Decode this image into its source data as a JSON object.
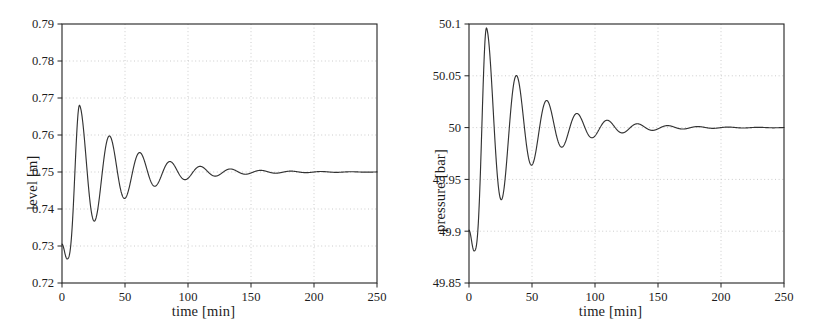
{
  "figure": {
    "background": "#ffffff",
    "line_color": "#333333",
    "grid_color": "#cccccc",
    "axis_color": "#222222"
  },
  "chart_data": [
    {
      "type": "line",
      "panel": "left",
      "title": "",
      "xlabel": "time [min]",
      "ylabel": "level [m]",
      "xlim": [
        0,
        250
      ],
      "ylim": [
        0.72,
        0.79
      ],
      "xticks": [
        0,
        50,
        100,
        150,
        200,
        250
      ],
      "xtick_labels": [
        "0",
        "50",
        "100",
        "150",
        "200",
        "250"
      ],
      "yticks": [
        0.72,
        0.73,
        0.74,
        0.75,
        0.76,
        0.77,
        0.78,
        0.79
      ],
      "ytick_labels": [
        "0.72",
        "0.73",
        "0.74",
        "0.75",
        "0.76",
        "0.77",
        "0.78",
        "0.79"
      ],
      "grid": true,
      "legend": null,
      "series": [
        {
          "name": "level",
          "steady_state": 0.75,
          "initial_value": 0.7305,
          "description": "damped oscillation settling to 0.75 m",
          "extrema": [
            {
              "t": 0,
              "y": 0.7305
            },
            {
              "t": 4,
              "y": 0.7265
            },
            {
              "t": 14,
              "y": 0.768
            },
            {
              "t": 26,
              "y": 0.7373
            },
            {
              "t": 38,
              "y": 0.7597
            },
            {
              "t": 50,
              "y": 0.7432
            },
            {
              "t": 62,
              "y": 0.7551
            },
            {
              "t": 74,
              "y": 0.7464
            },
            {
              "t": 86,
              "y": 0.7528
            },
            {
              "t": 98,
              "y": 0.7481
            },
            {
              "t": 110,
              "y": 0.7515
            },
            {
              "t": 122,
              "y": 0.7491
            },
            {
              "t": 134,
              "y": 0.7508
            },
            {
              "t": 146,
              "y": 0.7495
            },
            {
              "t": 158,
              "y": 0.7504
            },
            {
              "t": 170,
              "y": 0.7497
            },
            {
              "t": 182,
              "y": 0.7502
            },
            {
              "t": 194,
              "y": 0.7499
            },
            {
              "t": 250,
              "y": 0.75
            }
          ]
        }
      ]
    },
    {
      "type": "line",
      "panel": "right",
      "title": "",
      "xlabel": "time [min]",
      "ylabel": "pressure [bar]",
      "xlim": [
        0,
        250
      ],
      "ylim": [
        49.85,
        50.1
      ],
      "xticks": [
        0,
        50,
        100,
        150,
        200,
        250
      ],
      "xtick_labels": [
        "0",
        "50",
        "100",
        "150",
        "200",
        "250"
      ],
      "yticks": [
        49.85,
        49.9,
        49.95,
        50,
        50.05,
        50.1
      ],
      "ytick_labels": [
        "49.85",
        "49.9",
        "49.95",
        "50",
        "50.05",
        "50.1"
      ],
      "grid": true,
      "legend": null,
      "series": [
        {
          "name": "pressure",
          "steady_state": 50.0,
          "initial_value": 49.901,
          "description": "damped oscillation settling to 50 bar",
          "extrema": [
            {
              "t": 0,
              "y": 49.901
            },
            {
              "t": 4,
              "y": 49.881
            },
            {
              "t": 14,
              "y": 50.096
            },
            {
              "t": 26,
              "y": 49.937
            },
            {
              "t": 38,
              "y": 50.05
            },
            {
              "t": 50,
              "y": 49.965
            },
            {
              "t": 62,
              "y": 50.026
            },
            {
              "t": 74,
              "y": 49.98
            },
            {
              "t": 86,
              "y": 50.013
            },
            {
              "t": 98,
              "y": 49.991
            },
            {
              "t": 110,
              "y": 50.007
            },
            {
              "t": 122,
              "y": 49.996
            },
            {
              "t": 134,
              "y": 50.004
            },
            {
              "t": 146,
              "y": 49.998
            },
            {
              "t": 158,
              "y": 50.002
            },
            {
              "t": 170,
              "y": 49.999
            },
            {
              "t": 182,
              "y": 50.001
            },
            {
              "t": 194,
              "y": 50.0
            },
            {
              "t": 250,
              "y": 50.0
            }
          ]
        }
      ]
    }
  ]
}
